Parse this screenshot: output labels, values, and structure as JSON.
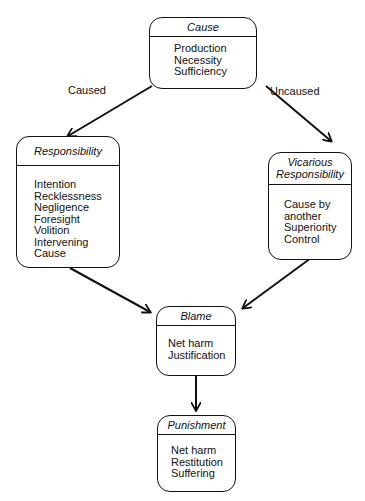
{
  "diagram": {
    "nodes": [
      {
        "id": "cause",
        "title": "Cause",
        "items": [
          "Production",
          "Necessity",
          "Sufficiency"
        ]
      },
      {
        "id": "responsibility",
        "title": "Responsibility",
        "items": [
          "Intention",
          "Recklessness",
          "Negligence",
          "Foresight",
          "Volition",
          "Intervening",
          "Cause"
        ]
      },
      {
        "id": "vicarious",
        "title": "Vicarious Responsibility",
        "title_lines": [
          "Vicarious",
          "Responsibility"
        ],
        "items": [
          "Cause by",
          "another",
          "Superiority",
          "Control"
        ]
      },
      {
        "id": "blame",
        "title": "Blame",
        "items": [
          "Net harm",
          "Justification"
        ]
      },
      {
        "id": "punishment",
        "title": "Punishment",
        "items": [
          "Net harm",
          "Restitution",
          "Suffering"
        ]
      }
    ],
    "edges": [
      {
        "from": "cause",
        "to": "responsibility",
        "label": "Caused"
      },
      {
        "from": "cause",
        "to": "vicarious",
        "label": "Uncaused"
      },
      {
        "from": "responsibility",
        "to": "blame",
        "label": ""
      },
      {
        "from": "vicarious",
        "to": "blame",
        "label": ""
      },
      {
        "from": "blame",
        "to": "punishment",
        "label": ""
      }
    ]
  }
}
